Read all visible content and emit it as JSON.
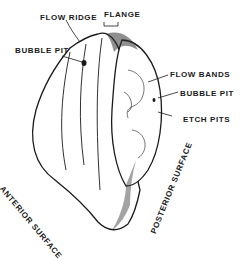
{
  "figure": {
    "labels": {
      "flow_ridge": "FLOW RIDGE",
      "flange": "FLANGE",
      "bubble_pit_left": "BUBBLE PIT",
      "flow_bands": "FLOW BANDS",
      "bubble_pit_right": "BUBBLE PIT",
      "etch_pits": "ETCH PITS",
      "anterior_surface": "ANTERIOR SURFACE",
      "posterior_surface": "POSTERIOR SURFACE"
    },
    "colors": {
      "ink": "#1a1a1a",
      "background": "#ffffff"
    }
  }
}
